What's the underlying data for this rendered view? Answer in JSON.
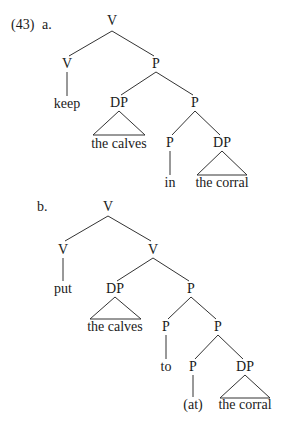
{
  "example_number": "(43)",
  "trees": [
    {
      "label": "a.",
      "label_pos": [
        45,
        29
      ],
      "nodes": [
        {
          "id": "a_root",
          "text": "V",
          "x": 112,
          "y": 25
        },
        {
          "id": "a_v",
          "text": "V",
          "x": 67,
          "y": 68
        },
        {
          "id": "a_keep",
          "text": "keep",
          "x": 67,
          "y": 108
        },
        {
          "id": "a_p1",
          "text": "P",
          "x": 156,
          "y": 68
        },
        {
          "id": "a_dp1",
          "text": "DP",
          "x": 119,
          "y": 107
        },
        {
          "id": "a_calves",
          "text": "the calves",
          "x": 119,
          "y": 148
        },
        {
          "id": "a_p2",
          "text": "P",
          "x": 195,
          "y": 107
        },
        {
          "id": "a_p3",
          "text": "P",
          "x": 170,
          "y": 147
        },
        {
          "id": "a_in",
          "text": "in",
          "x": 170,
          "y": 187
        },
        {
          "id": "a_dp2",
          "text": "DP",
          "x": 222,
          "y": 147
        },
        {
          "id": "a_corral",
          "text": "the corral",
          "x": 222,
          "y": 187
        }
      ]
    },
    {
      "label": "b.",
      "label_pos": [
        43,
        211
      ],
      "nodes": [
        {
          "id": "b_root",
          "text": "V",
          "x": 108,
          "y": 211
        },
        {
          "id": "b_v1",
          "text": "V",
          "x": 63,
          "y": 254
        },
        {
          "id": "b_put",
          "text": "put",
          "x": 63,
          "y": 293
        },
        {
          "id": "b_v2",
          "text": "V",
          "x": 153,
          "y": 254
        },
        {
          "id": "b_dp1",
          "text": "DP",
          "x": 115,
          "y": 293
        },
        {
          "id": "b_calves",
          "text": "the calves",
          "x": 115,
          "y": 331
        },
        {
          "id": "b_p1",
          "text": "P",
          "x": 191,
          "y": 293
        },
        {
          "id": "b_p2",
          "text": "P",
          "x": 166,
          "y": 331
        },
        {
          "id": "b_to",
          "text": "to",
          "x": 166,
          "y": 371
        },
        {
          "id": "b_p3",
          "text": "P",
          "x": 218,
          "y": 331
        },
        {
          "id": "b_p4",
          "text": "P",
          "x": 193,
          "y": 371
        },
        {
          "id": "b_at",
          "text": "(at)",
          "x": 193,
          "y": 409
        },
        {
          "id": "b_dp2",
          "text": "DP",
          "x": 245,
          "y": 371
        },
        {
          "id": "b_corral",
          "text": "the corral",
          "x": 245,
          "y": 409
        }
      ]
    }
  ],
  "colors": {
    "ink": "#1a1a1a",
    "line": "#333333",
    "background": "#ffffff"
  }
}
